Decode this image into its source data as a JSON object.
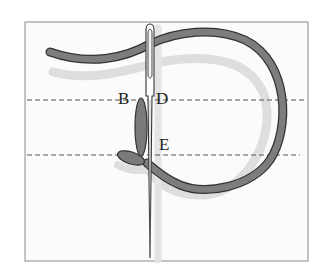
{
  "diagram": {
    "type": "embroidery-stitch-illustration",
    "labels": {
      "b": "B",
      "d": "D",
      "e": "E"
    },
    "elements": [
      "needle",
      "thread-loop",
      "stitch",
      "guide-line-upper",
      "guide-line-lower",
      "frame"
    ],
    "colors": {
      "thread": "#7a7a7a",
      "thread_outline": "#333333",
      "shadow": "#dcdcdc",
      "guide_line": "#555555",
      "frame": "#8a8a8a",
      "background": "#ffffff",
      "fabric": "#fbfbfb"
    }
  }
}
